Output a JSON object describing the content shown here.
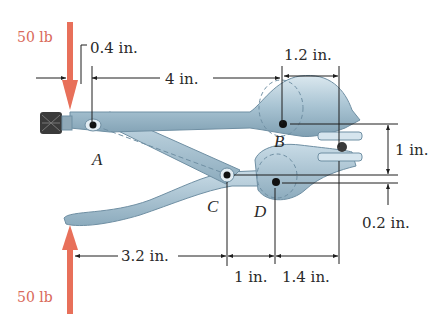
{
  "figure": {
    "colors": {
      "force_arrow": "#e8705a",
      "force_label": "#d9695a",
      "steel_light": "#c9dbe6",
      "steel_mid": "#9fbccd",
      "steel_dark": "#6f8fa3",
      "knob": "#3a3a3a",
      "pin": "#111111",
      "dimension_line": "#1e1e1e"
    },
    "forces": [
      {
        "id": "top",
        "label": "50 lb",
        "direction": "down"
      },
      {
        "id": "bottom",
        "label": "50 lb",
        "direction": "up"
      }
    ],
    "points": {
      "A": "A",
      "B": "B",
      "C": "C",
      "D": "D"
    },
    "dimensions": {
      "top_offset": "0.4 in.",
      "top_span": "4 in.",
      "jaw_span": "1.2 in.",
      "vertical_jaw": "1 in.",
      "vertical_small": "0.2 in.",
      "bottom_span": "3.2 in.",
      "bottom_mid": "1 in.",
      "bottom_right": "1.4 in."
    }
  }
}
